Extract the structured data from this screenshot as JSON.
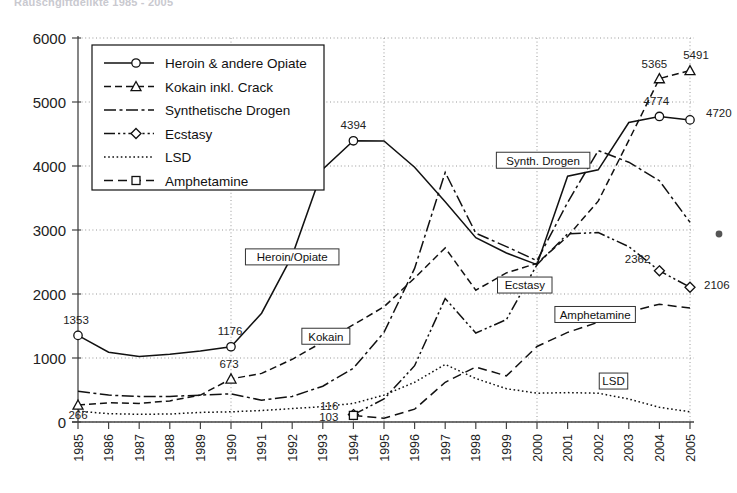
{
  "title_partial": "Rauschgiftdelikte 1985 - 2005",
  "chart_data": {
    "type": "line",
    "title": "Rauschgiftdelikte 1985 - 2005",
    "xlabel": "",
    "ylabel": "",
    "ylim": [
      0,
      6000
    ],
    "ytick_labels": [
      "0",
      "1000",
      "2000",
      "3000",
      "4000",
      "5000",
      "6000"
    ],
    "ytick_values": [
      0,
      1000,
      2000,
      3000,
      4000,
      5000,
      6000
    ],
    "grid": true,
    "grid_x_years": [
      1990,
      1995,
      2000,
      2005
    ],
    "legend_position": "upper-left-inside",
    "categories": [
      "1985",
      "1986",
      "1987",
      "1988",
      "1989",
      "1990",
      "1991",
      "1992",
      "1993",
      "1994",
      "1995",
      "1996",
      "1997",
      "1998",
      "1999",
      "2000",
      "2001",
      "2002",
      "2003",
      "2004",
      "2005"
    ],
    "x": [
      1985,
      1986,
      1987,
      1988,
      1989,
      1990,
      1991,
      1992,
      1993,
      1994,
      1995,
      1996,
      1997,
      1998,
      1999,
      2000,
      2001,
      2002,
      2003,
      2004,
      2005
    ],
    "series": [
      {
        "name": "Heroin & andere Opiate",
        "marker": "circle",
        "dash": "solid",
        "values": [
          1353,
          1090,
          1025,
          1060,
          1110,
          1176,
          1700,
          2600,
          3950,
          4394,
          4390,
          3980,
          3440,
          2880,
          2640,
          2460,
          3840,
          3940,
          4680,
          4774,
          4720
        ]
      },
      {
        "name": "Kokain inkl. Crack",
        "marker": "triangle",
        "dash": "dashed",
        "values": [
          266,
          300,
          290,
          330,
          420,
          673,
          760,
          980,
          1250,
          1520,
          1800,
          2250,
          2720,
          2060,
          2330,
          2480,
          2900,
          3450,
          4400,
          5365,
          5491
        ]
      },
      {
        "name": "Synthetische Drogen",
        "marker": "none",
        "dash": "dashdot",
        "values": [
          480,
          420,
          400,
          400,
          420,
          440,
          340,
          400,
          560,
          840,
          1400,
          2400,
          3900,
          2950,
          2740,
          2520,
          3430,
          4240,
          4060,
          3770,
          3120
        ]
      },
      {
        "name": "Ecstasy",
        "marker": "diamond",
        "dash": "dashdotdot",
        "values": [
          0,
          0,
          0,
          0,
          0,
          0,
          0,
          0,
          0,
          116,
          360,
          880,
          1930,
          1390,
          1600,
          2460,
          2940,
          2960,
          2740,
          2362,
          2106
        ]
      },
      {
        "name": "LSD",
        "marker": "none",
        "dash": "dotted",
        "values": [
          170,
          130,
          120,
          125,
          150,
          160,
          180,
          210,
          240,
          290,
          420,
          620,
          900,
          680,
          520,
          450,
          460,
          450,
          360,
          230,
          160
        ]
      },
      {
        "name": "Amphetamine",
        "marker": "square",
        "dash": "longdash",
        "values": [
          0,
          0,
          0,
          0,
          0,
          0,
          0,
          0,
          0,
          103,
          60,
          200,
          620,
          860,
          720,
          1180,
          1400,
          1560,
          1720,
          1840,
          1780
        ]
      }
    ],
    "data_labels": [
      {
        "series": "Heroin & andere Opiate",
        "year": 1985,
        "value": 1353,
        "text": "1353"
      },
      {
        "series": "Heroin & andere Opiate",
        "year": 1990,
        "value": 1176,
        "text": "1176"
      },
      {
        "series": "Heroin & andere Opiate",
        "year": 1994,
        "value": 4394,
        "text": "4394"
      },
      {
        "series": "Heroin & andere Opiate",
        "year": 2004,
        "value": 4774,
        "text": "4774"
      },
      {
        "series": "Heroin & andere Opiate",
        "year": 2005,
        "value": 4720,
        "text": "4720"
      },
      {
        "series": "Kokain inkl. Crack",
        "year": 1985,
        "value": 266,
        "text": "266"
      },
      {
        "series": "Kokain inkl. Crack",
        "year": 1990,
        "value": 673,
        "text": "673"
      },
      {
        "series": "Kokain inkl. Crack",
        "year": 2004,
        "value": 5365,
        "text": "5365"
      },
      {
        "series": "Kokain inkl. Crack",
        "year": 2005,
        "value": 5491,
        "text": "5491"
      },
      {
        "series": "Ecstasy",
        "year": 1994,
        "value": 116,
        "text": "116"
      },
      {
        "series": "Ecstasy",
        "year": 2004,
        "value": 2362,
        "text": "2362"
      },
      {
        "series": "Ecstasy",
        "year": 2005,
        "value": 2106,
        "text": "2106"
      },
      {
        "series": "Amphetamine",
        "year": 1994,
        "value": 103,
        "text": "103"
      }
    ],
    "annotations": [
      {
        "text": "Heroin/Opiate",
        "x": 1992.0,
        "y": 2580
      },
      {
        "text": "Kokain",
        "x": 1993.1,
        "y": 1340
      },
      {
        "text": "Synth. Drogen",
        "x": 2000.2,
        "y": 4090
      },
      {
        "text": "Ecstasy",
        "x": 1999.6,
        "y": 2140
      },
      {
        "text": "Amphetamine",
        "x": 2001.9,
        "y": 1680
      },
      {
        "text": "LSD",
        "x": 2002.5,
        "y": 640
      }
    ]
  },
  "legend": {
    "entries": [
      {
        "label": "Heroin & andere Opiate"
      },
      {
        "label": "Kokain inkl. Crack"
      },
      {
        "label": "Synthetische Drogen"
      },
      {
        "label": "Ecstasy"
      },
      {
        "label": "LSD"
      },
      {
        "label": "Amphetamine"
      }
    ]
  },
  "axes": {
    "y_labels": [
      "6000",
      "5000",
      "4000",
      "3000",
      "2000",
      "1000",
      "0"
    ],
    "x_labels": [
      "1985",
      "1986",
      "1987",
      "1988",
      "1989",
      "1990",
      "1991",
      "1992",
      "1993",
      "1994",
      "1995",
      "1996",
      "1997",
      "1998",
      "1999",
      "2000",
      "2001",
      "2002",
      "2003",
      "2004",
      "2005"
    ]
  }
}
